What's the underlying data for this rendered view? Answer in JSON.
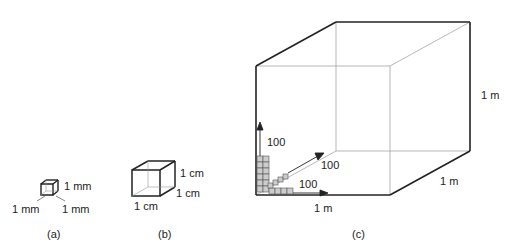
{
  "figure": {
    "panel_a": {
      "caption": "(a)",
      "labels": {
        "height": "1 mm",
        "width": "1 mm",
        "depth": "1 mm"
      }
    },
    "panel_b": {
      "caption": "(b)",
      "labels": {
        "height": "1 cm",
        "depth": "1 cm",
        "width": "1 cm"
      }
    },
    "panel_c": {
      "caption": "(c)",
      "labels": {
        "height": "1 m",
        "depth": "1 m",
        "width": "1 m"
      },
      "arrows": {
        "up": "100",
        "diagonal": "100",
        "right": "100"
      }
    }
  }
}
